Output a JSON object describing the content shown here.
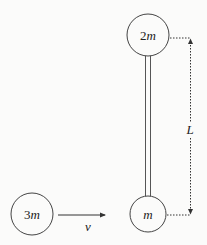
{
  "diagram": {
    "type": "physics-collision",
    "colors": {
      "stroke": "#444444",
      "rod": "#555555",
      "text": "#222222",
      "background": "#fbfbfa"
    },
    "bodies": [
      {
        "id": "top-mass",
        "label_num": "2",
        "label_var": "m"
      },
      {
        "id": "bottom-mass",
        "label_num": "",
        "label_var": "m"
      },
      {
        "id": "incoming-mass",
        "label_num": "3",
        "label_var": "m"
      }
    ],
    "rod": {
      "connects": [
        "top-mass",
        "bottom-mass"
      ]
    },
    "velocity": {
      "label": "v",
      "direction": "right"
    },
    "length": {
      "label": "L"
    }
  }
}
